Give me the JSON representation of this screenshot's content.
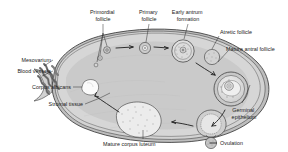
{
  "figure": {
    "background_color": "#ffffff",
    "stroke_color": "#3a3a3a",
    "label_color": "#1a1a1a"
  },
  "colors": {
    "cortex_fill": "#d8d8d8",
    "medulla_fill": "#c9c9c9",
    "inner_fill": "#e3e3e3",
    "capsule_fill": "#bdbdbd",
    "follicle_fill": "#cccccc",
    "follicle_inner": "#e8e8e8",
    "corpus_albicans_fill": "#fbfbfb",
    "corpus_luteum_fill": "#ededed",
    "vessel_fill": "#8a8a8a",
    "ovum_fill": "#c0c0c0"
  },
  "labels": [
    {
      "id": "primordial-follicle",
      "text_lines": [
        "Primordial",
        "follicle"
      ],
      "x": 103,
      "y": 13,
      "align": "middle"
    },
    {
      "id": "primary-follicle",
      "text_lines": [
        "Primary",
        "follicle"
      ],
      "x": 149,
      "y": 13,
      "align": "middle"
    },
    {
      "id": "early-antrum-formation",
      "text_lines": [
        "Early antrum",
        "formation"
      ],
      "x": 188,
      "y": 13,
      "align": "middle"
    },
    {
      "id": "atretic-follicle",
      "text_lines": [
        "Atretic follicle"
      ],
      "x": 220,
      "y": 33,
      "align": "start"
    },
    {
      "id": "mature-antral-follicle",
      "text_lines": [
        "Mature antral follicle"
      ],
      "x": 229,
      "y": 50,
      "align": "start"
    },
    {
      "id": "germinal-epithelium",
      "text_lines": [
        "Germinal",
        "epithelium"
      ],
      "x": 242,
      "y": 110,
      "align": "middle"
    },
    {
      "id": "ovulation",
      "text_lines": [
        "Ovulation"
      ],
      "x": 213,
      "y": 132,
      "align": "start"
    },
    {
      "id": "mature-corpus-luteum",
      "text_lines": [
        "Mature corpus luteum"
      ],
      "x": 106,
      "y": 143,
      "align": "start"
    },
    {
      "id": "stromal-tissue",
      "text_lines": [
        "Stromal tissue"
      ],
      "x": 83,
      "y": 106,
      "align": "end"
    },
    {
      "id": "corpus-albicans",
      "text_lines": [
        "Corpus albicans"
      ],
      "x": 71,
      "y": 89,
      "align": "end"
    },
    {
      "id": "blood-vessels",
      "text_lines": [
        "Blood vessels"
      ],
      "x": 51,
      "y": 73,
      "align": "end"
    },
    {
      "id": "mesovarium",
      "text_lines": [
        "Mesovarium"
      ],
      "x": 51,
      "y": 62,
      "align": "end"
    }
  ],
  "structures": [
    {
      "id": "ovary-body",
      "name": "ovary-outline"
    },
    {
      "id": "mesovarium-hilum",
      "name": "mesovarium-blood-vessels"
    },
    {
      "id": "primordial-follicle-1",
      "name": "primordial-follicle"
    },
    {
      "id": "primary-follicle-1",
      "name": "primary-follicle"
    },
    {
      "id": "early-antrum-follicle",
      "name": "early-antrum-follicle"
    },
    {
      "id": "atretic-follicle-1",
      "name": "atretic-follicle"
    },
    {
      "id": "mature-antral-follicle-1",
      "name": "mature-antral-follicle"
    },
    {
      "id": "ovulating-follicle",
      "name": "ovulating-follicle"
    },
    {
      "id": "released-ovum",
      "name": "released-ovum"
    },
    {
      "id": "corpus-luteum",
      "name": "mature-corpus-luteum"
    },
    {
      "id": "corpus-albicans-1",
      "name": "corpus-albicans"
    }
  ],
  "flow_arrows": [
    {
      "id": "arrow-primordial-to-primary"
    },
    {
      "id": "arrow-primary-to-antrum"
    },
    {
      "id": "arrow-antrum-to-mature"
    },
    {
      "id": "arrow-mature-to-ovulation"
    },
    {
      "id": "arrow-ovulation-to-luteum"
    },
    {
      "id": "arrow-luteum-to-albicans"
    }
  ]
}
